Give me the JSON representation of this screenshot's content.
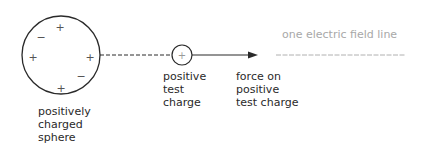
{
  "diagram": {
    "title": "one electric field line",
    "sphere": {
      "label": "positively\ncharged\nsphere",
      "charges": [
        {
          "sign": "+",
          "x": 60,
          "y": 27
        },
        {
          "sign": "−",
          "x": 41,
          "y": 37
        },
        {
          "sign": "+",
          "x": 33,
          "y": 57
        },
        {
          "sign": "+",
          "x": 90,
          "y": 57
        },
        {
          "sign": "−",
          "x": 81,
          "y": 76
        },
        {
          "sign": "+",
          "x": 61,
          "y": 88
        }
      ]
    },
    "test_charge": {
      "sign": "+",
      "label": "positive\ntest\ncharge"
    },
    "force": {
      "label": "force on\npositive\ntest charge"
    },
    "colors": {
      "ink": "#2a2a2a",
      "faint": "#a8a8a8"
    }
  }
}
